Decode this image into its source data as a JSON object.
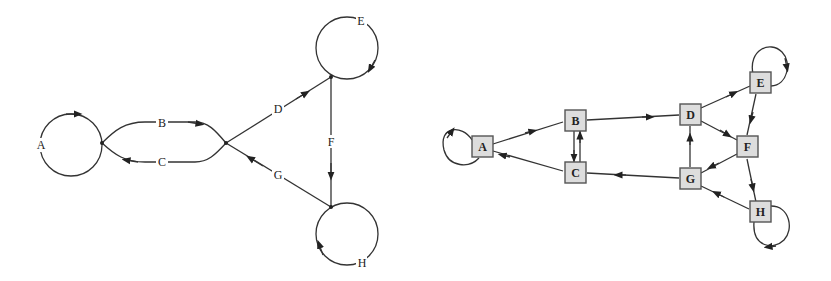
{
  "left_diagram": {
    "description": "Dual graph: edges rendered as labeled arcs between junction points",
    "labels": {
      "A": "A",
      "B": "B",
      "C": "C",
      "D": "D",
      "E": "E",
      "F": "F",
      "G": "G",
      "H": "H"
    }
  },
  "right_diagram": {
    "description": "Directed graph with square nodes",
    "nodes": [
      {
        "id": "A",
        "label": "A"
      },
      {
        "id": "B",
        "label": "B"
      },
      {
        "id": "C",
        "label": "C"
      },
      {
        "id": "D",
        "label": "D"
      },
      {
        "id": "E",
        "label": "E"
      },
      {
        "id": "F",
        "label": "F"
      },
      {
        "id": "G",
        "label": "G"
      },
      {
        "id": "H",
        "label": "H"
      }
    ],
    "edges": [
      {
        "from": "A",
        "to": "A"
      },
      {
        "from": "A",
        "to": "B"
      },
      {
        "from": "C",
        "to": "A"
      },
      {
        "from": "B",
        "to": "C"
      },
      {
        "from": "C",
        "to": "B"
      },
      {
        "from": "B",
        "to": "D"
      },
      {
        "from": "G",
        "to": "C"
      },
      {
        "from": "G",
        "to": "D"
      },
      {
        "from": "D",
        "to": "E"
      },
      {
        "from": "D",
        "to": "F"
      },
      {
        "from": "E",
        "to": "E"
      },
      {
        "from": "E",
        "to": "F"
      },
      {
        "from": "F",
        "to": "G"
      },
      {
        "from": "F",
        "to": "H"
      },
      {
        "from": "H",
        "to": "G"
      },
      {
        "from": "H",
        "to": "H"
      }
    ]
  },
  "colors": {
    "stroke": "#333333",
    "node_fill": "#dddddd",
    "node_border": "#555555",
    "background": "#ffffff"
  }
}
